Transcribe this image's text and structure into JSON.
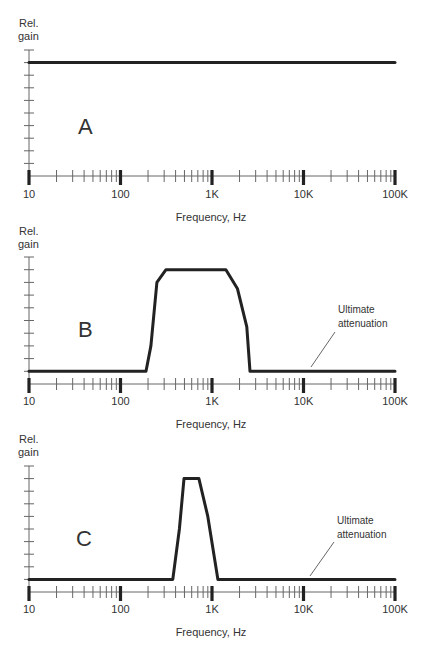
{
  "chart_data": [
    {
      "type": "line",
      "panel_label": "A",
      "title": "",
      "xlabel": "Frequency, Hz",
      "ylabel": "Rel. gain",
      "xscale": "log",
      "xlim": [
        10,
        100000
      ],
      "ylim": [
        0,
        10
      ],
      "xticks": [
        "10",
        "100",
        "1K",
        "10K",
        "100K"
      ],
      "series": [
        {
          "name": "Response A (flat)",
          "x": [
            10,
            100000
          ],
          "y": [
            9,
            9
          ]
        }
      ]
    },
    {
      "type": "line",
      "panel_label": "B",
      "title": "",
      "xlabel": "Frequency, Hz",
      "ylabel": "Rel. gain",
      "xscale": "log",
      "xlim": [
        10,
        100000
      ],
      "ylim": [
        0,
        10
      ],
      "xticks": [
        "10",
        "100",
        "1K",
        "10K",
        "100K"
      ],
      "annotations": [
        "Ultimate attenuation"
      ],
      "series": [
        {
          "name": "Response B (wide bandpass)",
          "x": [
            10,
            190,
            215,
            250,
            314,
            1420,
            1900,
            2400,
            2600,
            100000
          ],
          "y": [
            1,
            1,
            3,
            8,
            9,
            9,
            7.5,
            4.5,
            1,
            1
          ]
        }
      ]
    },
    {
      "type": "line",
      "panel_label": "C",
      "title": "",
      "xlabel": "Frequency, Hz",
      "ylabel": "Rel. gain",
      "xscale": "log",
      "xlim": [
        10,
        100000
      ],
      "ylim": [
        0,
        10
      ],
      "xticks": [
        "10",
        "100",
        "1K",
        "10K",
        "100K"
      ],
      "annotations": [
        "Ultimate attenuation"
      ],
      "series": [
        {
          "name": "Response C (narrow bandpass)",
          "x": [
            10,
            373,
            440,
            494,
            720,
            900,
            1160,
            100000
          ],
          "y": [
            1,
            1,
            5,
            9,
            9,
            6,
            1,
            1
          ]
        }
      ]
    }
  ],
  "panels": [
    {
      "label": "A",
      "ylabel_line1": "Rel.",
      "ylabel_line2": "gain",
      "xlabel": "Frequency, Hz"
    },
    {
      "label": "B",
      "ylabel_line1": "Rel.",
      "ylabel_line2": "gain",
      "xlabel": "Frequency, Hz",
      "annotation_line1": "Ultimate",
      "annotation_line2": "attenuation"
    },
    {
      "label": "C",
      "ylabel_line1": "Rel.",
      "ylabel_line2": "gain",
      "xlabel": "Frequency, Hz",
      "annotation_line1": "Ultimate",
      "annotation_line2": "attenuation"
    }
  ],
  "xtick_labels": [
    "10",
    "100",
    "1K",
    "10K",
    "100K"
  ],
  "colors": {
    "curve": "#222222",
    "axis": "#666666",
    "text": "#333333",
    "background": "#ffffff"
  }
}
